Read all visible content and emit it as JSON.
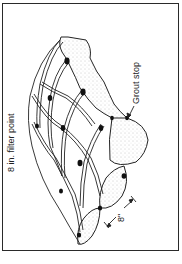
{
  "figure": {
    "labels": {
      "filter_point": "8 in. filter point",
      "grout_stop": "Grout stop",
      "dimension": "8\""
    },
    "colors": {
      "line": "#222222",
      "frame": "#2a2a2a",
      "stipple": "#8a8a8a",
      "background": "#ffffff"
    }
  }
}
